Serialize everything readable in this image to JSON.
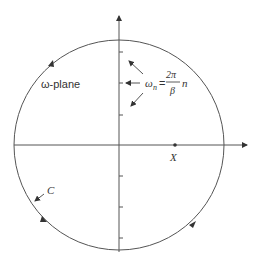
{
  "diagram": {
    "plane_label": "ω-plane",
    "contour_label": "C",
    "point_label": "X",
    "formula": {
      "lhs": "ω",
      "lhs_sub": "n",
      "equals": "=",
      "numerator": "2π",
      "denominator": "β",
      "trailing": "n"
    },
    "colors": {
      "line": "#555555",
      "text": "#333333",
      "background": "#ffffff"
    }
  }
}
